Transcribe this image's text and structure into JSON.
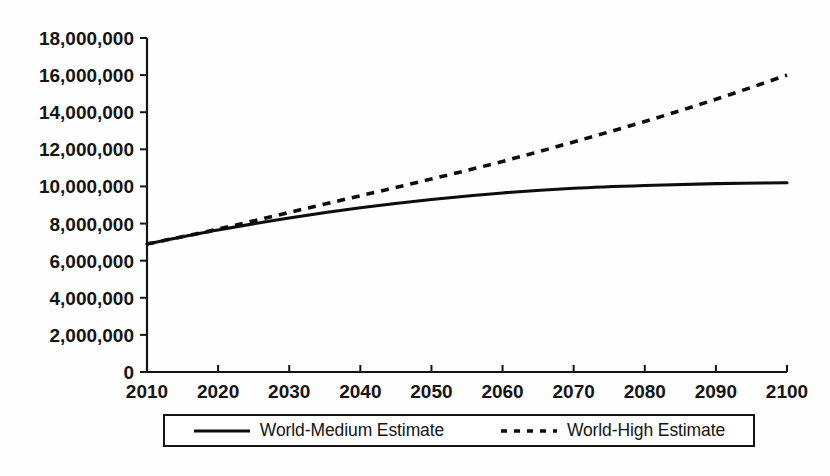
{
  "chart_data": {
    "type": "line",
    "title": "",
    "subtitle": "",
    "xlabel": "",
    "ylabel": "",
    "xlim": [
      2010,
      2100
    ],
    "ylim": [
      0,
      18000000
    ],
    "grid": false,
    "legend_position": "bottom",
    "x": [
      2010,
      2020,
      2030,
      2040,
      2050,
      2060,
      2070,
      2080,
      2090,
      2100
    ],
    "x_tick_labels": [
      "2010",
      "2020",
      "2030",
      "2040",
      "2050",
      "2060",
      "2070",
      "2080",
      "2090",
      "2100"
    ],
    "y_ticks": [
      0,
      2000000,
      4000000,
      6000000,
      8000000,
      10000000,
      12000000,
      14000000,
      16000000,
      18000000
    ],
    "y_tick_labels": [
      "0",
      "2,000,000",
      "4,000,000",
      "6,000,000",
      "8,000,000",
      "10,000,000",
      "12,000,000",
      "14,000,000",
      "16,000,000",
      "18,000,000"
    ],
    "series": [
      {
        "name": "World-Medium Estimate",
        "style": "solid",
        "color": "#0d0d0d",
        "values": [
          6900000,
          7650000,
          8300000,
          8850000,
          9300000,
          9650000,
          9900000,
          10050000,
          10150000,
          10200000
        ]
      },
      {
        "name": "World-High Estimate",
        "style": "dashed",
        "color": "#0d0d0d",
        "values": [
          6900000,
          7700000,
          8600000,
          9500000,
          10400000,
          11350000,
          12400000,
          13500000,
          14700000,
          16000000
        ]
      }
    ]
  },
  "legend": {
    "entries": [
      {
        "label": "World-Medium Estimate",
        "style": "solid"
      },
      {
        "label": "World-High Estimate",
        "style": "dashed"
      }
    ]
  },
  "colors": {
    "ink": "#141414",
    "background": "#fefefe",
    "series": "#0d0d0d"
  }
}
